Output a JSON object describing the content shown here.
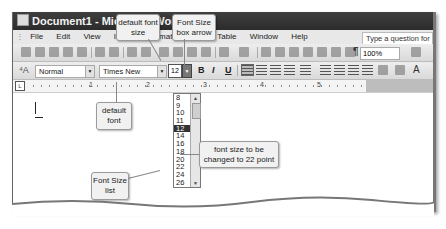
{
  "window": {
    "title": "Document1 - Microsoft Word"
  },
  "menubar": {
    "items": [
      "File",
      "Edit",
      "View",
      "Insert",
      "Format",
      "Tools",
      "Table",
      "Window",
      "Help"
    ],
    "ask_placeholder": "Type a question for help"
  },
  "standard_toolbar": {
    "zoom": "100%",
    "icons": [
      "new-icon",
      "open-icon",
      "save-icon",
      "permission-icon",
      "email-icon",
      "print-icon",
      "print-preview-icon",
      "spelling-icon",
      "research-icon",
      "cut-icon",
      "copy-icon",
      "paste-icon",
      "format-painter-icon",
      "undo-icon",
      "redo-icon",
      "hyperlink-icon",
      "tables-borders-icon",
      "insert-table-icon",
      "insert-excel-icon",
      "columns-icon",
      "drawing-icon",
      "document-map-icon",
      "show-hide-icon",
      "help-icon"
    ]
  },
  "formatting_toolbar": {
    "style": "Normal",
    "font": "Times New Roman",
    "font_size": "12",
    "bold": "B",
    "italic": "I",
    "underline": "U"
  },
  "ruler": {
    "tab_selector": "L",
    "numbers": [
      "1",
      "2",
      "3",
      "4",
      "5"
    ]
  },
  "font_size_list": {
    "items": [
      "8",
      "9",
      "10",
      "11",
      "12",
      "14",
      "16",
      "18",
      "20",
      "22",
      "24",
      "26"
    ],
    "selected": "12"
  },
  "callouts": {
    "default_font_size": "default font size",
    "font_size_box_arrow": "Font Size box arrow",
    "default_font": "default font",
    "font_size_list": "Font Size list",
    "change_to_22": "font size to be changed to 22 point"
  }
}
